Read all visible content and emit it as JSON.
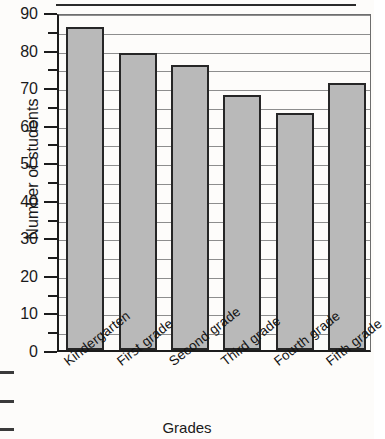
{
  "chart_data": {
    "type": "bar",
    "title": "",
    "xlabel": "Grades",
    "ylabel": "Number of students",
    "categories": [
      "Kindergarten",
      "First grade",
      "Second grade",
      "Third grade",
      "Fourth grade",
      "Fifth grade"
    ],
    "values": [
      86,
      79,
      76,
      68,
      63,
      71
    ],
    "ylim": [
      0,
      90
    ],
    "y_major_ticks": [
      0,
      10,
      20,
      30,
      40,
      50,
      60,
      70,
      80,
      90
    ],
    "y_minor_tick_step": 5,
    "y_tick_labels": [
      "0",
      "10",
      "20",
      "30",
      "40",
      "50",
      "60",
      "70",
      "80",
      "90"
    ],
    "grid": "horizontal",
    "grid_step": 5,
    "legend": "none",
    "bar_fill_color": "#b9b9b9",
    "bar_edge_color": "#262626",
    "background_color": "#fdfcfa",
    "axis_color": "#1c1c1c",
    "gridline_color": "#8d8d8d"
  },
  "axes": {
    "y_title": "Number of students",
    "x_title": "Grades"
  },
  "artifacts": {
    "top_rule": "scan-line",
    "edge_dashes": [
      "dash",
      "dash",
      "dash"
    ]
  }
}
